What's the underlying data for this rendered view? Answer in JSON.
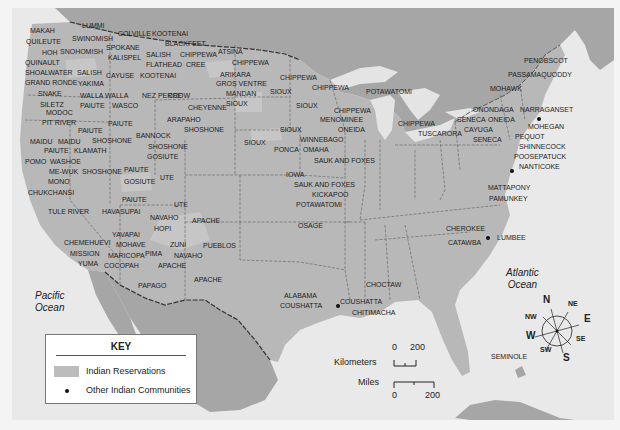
{
  "map": {
    "colors": {
      "water": "#e9e9e9",
      "canada_land": "#a6a6a6",
      "us_land": "#b8b8b8",
      "reservation": "#c8c8c8",
      "borders": "#6a6a6a",
      "label_text": "#1c1c1c"
    },
    "oceans": {
      "pacific": [
        "Pacific",
        "Ocean"
      ],
      "atlantic": [
        "Atlantic",
        "Ocean"
      ]
    },
    "labels": [
      {
        "text": "MAKAH",
        "x": 30,
        "y": 31
      },
      {
        "text": "LUMMI",
        "x": 82,
        "y": 26
      },
      {
        "text": "QUILEUTE",
        "x": 26,
        "y": 42
      },
      {
        "text": "SWINOMISH",
        "x": 72,
        "y": 39
      },
      {
        "text": "COLVILLE",
        "x": 118,
        "y": 34
      },
      {
        "text": "KOOTENAI",
        "x": 152,
        "y": 34
      },
      {
        "text": "HOH",
        "x": 42,
        "y": 53
      },
      {
        "text": "SNOHOMISH",
        "x": 60,
        "y": 52
      },
      {
        "text": "SPOKANE",
        "x": 106,
        "y": 48
      },
      {
        "text": "BLACKFEET",
        "x": 165,
        "y": 44
      },
      {
        "text": "QUINAULT",
        "x": 25,
        "y": 63
      },
      {
        "text": "SALISH",
        "x": 146,
        "y": 55
      },
      {
        "text": "CHIPPEWA",
        "x": 180,
        "y": 55
      },
      {
        "text": "ATSINA",
        "x": 218,
        "y": 52
      },
      {
        "text": "KALISPEL",
        "x": 108,
        "y": 58
      },
      {
        "text": "FLATHEAD",
        "x": 146,
        "y": 65
      },
      {
        "text": "CREE",
        "x": 186,
        "y": 65
      },
      {
        "text": "CHIPPEWA",
        "x": 232,
        "y": 63
      },
      {
        "text": "SHOALWATER",
        "x": 25,
        "y": 73
      },
      {
        "text": "SALISH",
        "x": 77,
        "y": 73
      },
      {
        "text": "CAYUSE",
        "x": 106,
        "y": 76
      },
      {
        "text": "KOOTENAI",
        "x": 140,
        "y": 76
      },
      {
        "text": "ARIKARA",
        "x": 220,
        "y": 75
      },
      {
        "text": "CHIPPEWA",
        "x": 280,
        "y": 78
      },
      {
        "text": "GRAND RONDE",
        "x": 25,
        "y": 83
      },
      {
        "text": "YAKIMA",
        "x": 78,
        "y": 84
      },
      {
        "text": "GROS VENTRE",
        "x": 216,
        "y": 84
      },
      {
        "text": "SNAKE",
        "x": 38,
        "y": 94
      },
      {
        "text": "WALLA WALLA",
        "x": 80,
        "y": 96
      },
      {
        "text": "NEZ PERCE",
        "x": 142,
        "y": 96
      },
      {
        "text": "CROW",
        "x": 168,
        "y": 96
      },
      {
        "text": "MANDAN",
        "x": 226,
        "y": 94
      },
      {
        "text": "SIOUX",
        "x": 270,
        "y": 92
      },
      {
        "text": "CHIPPEWA",
        "x": 312,
        "y": 88
      },
      {
        "text": "POTAWATOMI",
        "x": 366,
        "y": 92
      },
      {
        "text": "SILETZ",
        "x": 40,
        "y": 105
      },
      {
        "text": "PAIUTE",
        "x": 80,
        "y": 106
      },
      {
        "text": "WASCO",
        "x": 112,
        "y": 106
      },
      {
        "text": "CHEYENNE",
        "x": 188,
        "y": 108
      },
      {
        "text": "SIOUX",
        "x": 226,
        "y": 104
      },
      {
        "text": "SIOUX",
        "x": 296,
        "y": 106
      },
      {
        "text": "CHIPPEWA",
        "x": 334,
        "y": 111
      },
      {
        "text": "MODOC",
        "x": 46,
        "y": 113
      },
      {
        "text": "PIT RIVER",
        "x": 42,
        "y": 123
      },
      {
        "text": "PAIUTE",
        "x": 108,
        "y": 124
      },
      {
        "text": "ARAPAHO",
        "x": 167,
        "y": 120
      },
      {
        "text": "MENOMINEE",
        "x": 320,
        "y": 120
      },
      {
        "text": "ONEIDA",
        "x": 338,
        "y": 130
      },
      {
        "text": "CHIPPEWA",
        "x": 398,
        "y": 124
      },
      {
        "text": "SIOUX",
        "x": 280,
        "y": 130
      },
      {
        "text": "SHOSHONE",
        "x": 184,
        "y": 130
      },
      {
        "text": "PAIUTE",
        "x": 78,
        "y": 131
      },
      {
        "text": "MAIDU",
        "x": 30,
        "y": 142
      },
      {
        "text": "MAIDU",
        "x": 58,
        "y": 142
      },
      {
        "text": "SHOSHONE",
        "x": 92,
        "y": 141
      },
      {
        "text": "BANNOCK",
        "x": 136,
        "y": 136
      },
      {
        "text": "SIOUX",
        "x": 244,
        "y": 143
      },
      {
        "text": "WINNEBAGO",
        "x": 300,
        "y": 140
      },
      {
        "text": "PAIUTE",
        "x": 44,
        "y": 151
      },
      {
        "text": "KLAMATH",
        "x": 74,
        "y": 151
      },
      {
        "text": "SHOSHONE",
        "x": 148,
        "y": 147
      },
      {
        "text": "PONCA",
        "x": 274,
        "y": 150
      },
      {
        "text": "OMAHA",
        "x": 303,
        "y": 150
      },
      {
        "text": "POMO",
        "x": 25,
        "y": 162
      },
      {
        "text": "WASHOE",
        "x": 50,
        "y": 162
      },
      {
        "text": "GOSIUTE",
        "x": 147,
        "y": 157
      },
      {
        "text": "SAUK AND FOXES",
        "x": 314,
        "y": 161
      },
      {
        "text": "ME-WUK",
        "x": 49,
        "y": 172
      },
      {
        "text": "SHOSHONE",
        "x": 82,
        "y": 172
      },
      {
        "text": "PAIUTE",
        "x": 124,
        "y": 170
      },
      {
        "text": "IOWA",
        "x": 286,
        "y": 175
      },
      {
        "text": "MONO",
        "x": 48,
        "y": 182
      },
      {
        "text": "GOSIUTE",
        "x": 124,
        "y": 182
      },
      {
        "text": "UTE",
        "x": 160,
        "y": 178
      },
      {
        "text": "SAUK AND FOXES",
        "x": 294,
        "y": 185
      },
      {
        "text": "CHUKCHANSI",
        "x": 28,
        "y": 193
      },
      {
        "text": "KICKAPOO",
        "x": 312,
        "y": 195
      },
      {
        "text": "POTAWATOMI",
        "x": 296,
        "y": 205
      },
      {
        "text": "PAIUTE",
        "x": 122,
        "y": 200
      },
      {
        "text": "UTE",
        "x": 174,
        "y": 205
      },
      {
        "text": "HAVASUPAI",
        "x": 102,
        "y": 212
      },
      {
        "text": "TULE RIVER",
        "x": 48,
        "y": 212
      },
      {
        "text": "NAVAHO",
        "x": 150,
        "y": 218
      },
      {
        "text": "APACHE",
        "x": 192,
        "y": 221
      },
      {
        "text": "OSAGE",
        "x": 298,
        "y": 226
      },
      {
        "text": "HOPI",
        "x": 154,
        "y": 229
      },
      {
        "text": "YAVAPAI",
        "x": 112,
        "y": 235
      },
      {
        "text": "CHEROKEE",
        "x": 446,
        "y": 229
      },
      {
        "text": "LUMBEE",
        "x": 497,
        "y": 238
      },
      {
        "text": "CHEMEHUEVI",
        "x": 64,
        "y": 243
      },
      {
        "text": "MOHAVE",
        "x": 116,
        "y": 245
      },
      {
        "text": "ZUNI",
        "x": 170,
        "y": 245
      },
      {
        "text": "PUEBLOS",
        "x": 203,
        "y": 246
      },
      {
        "text": "CATAWBA",
        "x": 448,
        "y": 243
      },
      {
        "text": "MISSION",
        "x": 70,
        "y": 254
      },
      {
        "text": "MARICOPA",
        "x": 108,
        "y": 256
      },
      {
        "text": "PIMA",
        "x": 145,
        "y": 254
      },
      {
        "text": "NAVAHO",
        "x": 174,
        "y": 256
      },
      {
        "text": "YUMA",
        "x": 78,
        "y": 264
      },
      {
        "text": "COCOPAH",
        "x": 104,
        "y": 266
      },
      {
        "text": "APACHE",
        "x": 158,
        "y": 266
      },
      {
        "text": "APACHE",
        "x": 194,
        "y": 280
      },
      {
        "text": "CHOCTAW",
        "x": 366,
        "y": 285
      },
      {
        "text": "PAPAGO",
        "x": 138,
        "y": 286
      },
      {
        "text": "ALABAMA",
        "x": 284,
        "y": 296
      },
      {
        "text": "COUSHATTA",
        "x": 340,
        "y": 302
      },
      {
        "text": "COUSHATTA",
        "x": 280,
        "y": 306
      },
      {
        "text": "CHITIMACHA",
        "x": 352,
        "y": 313
      },
      {
        "text": "PENOBSCOT",
        "x": 524,
        "y": 61
      },
      {
        "text": "PASSAMAQUODDY",
        "x": 508,
        "y": 75
      },
      {
        "text": "MOHAWK",
        "x": 490,
        "y": 89
      },
      {
        "text": "ONONDAGA",
        "x": 473,
        "y": 110
      },
      {
        "text": "NARRAGANSET",
        "x": 520,
        "y": 110
      },
      {
        "text": "SENECA",
        "x": 457,
        "y": 120
      },
      {
        "text": "ONEIDA",
        "x": 488,
        "y": 120
      },
      {
        "text": "MOHEGAN",
        "x": 528,
        "y": 127
      },
      {
        "text": "CAYUGA",
        "x": 464,
        "y": 130
      },
      {
        "text": "TUSCARORA",
        "x": 418,
        "y": 134
      },
      {
        "text": "PEQUOT",
        "x": 515,
        "y": 137
      },
      {
        "text": "SENECA",
        "x": 473,
        "y": 140
      },
      {
        "text": "SHINNECOCK",
        "x": 519,
        "y": 147
      },
      {
        "text": "POOSEPATUCK",
        "x": 514,
        "y": 157
      },
      {
        "text": "NANTICOKE",
        "x": 519,
        "y": 167
      },
      {
        "text": "MATTAPONY",
        "x": 488,
        "y": 188
      },
      {
        "text": "PAMUNKEY",
        "x": 489,
        "y": 199
      },
      {
        "text": "SEMINOLE",
        "x": 491,
        "y": 357
      }
    ],
    "community_dots": [
      {
        "name": "NARRAGANSET",
        "x": 539,
        "y": 119
      },
      {
        "name": "NANTICOKE",
        "x": 512,
        "y": 171
      },
      {
        "name": "LUMBEE",
        "x": 488,
        "y": 238
      },
      {
        "name": "COUSHATTA",
        "x": 338,
        "y": 306
      }
    ]
  },
  "key": {
    "title": "KEY",
    "items": [
      {
        "label": "Indian Reservations",
        "symbol": "gray-swatch"
      },
      {
        "label": "Other Indian Communities",
        "symbol": "black-dot"
      }
    ]
  },
  "scale_bar": {
    "kilometers_label": "Kilometers",
    "km_start": "0",
    "km_end": "200",
    "miles_label": "Miles",
    "mi_start": "0",
    "mi_end": "200"
  },
  "compass": {
    "N": "N",
    "NE": "NE",
    "E": "E",
    "SE": "SE",
    "S": "S",
    "SW": "SW",
    "W": "W",
    "NW": "NW"
  }
}
